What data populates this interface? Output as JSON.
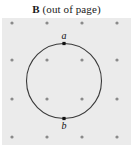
{
  "figure": {
    "caption": {
      "symbol": "B",
      "note": "(out of page)",
      "full_text": "B (out of page)"
    },
    "field": {
      "background_color": "#ebebeb",
      "dot_color": "#8a8a8a",
      "dot_symbol_name": "field-out-of-page-dot",
      "grid_columns": 4,
      "grid_rows": 4,
      "dot_count": 16,
      "dot_positions_x": [
        12,
        47,
        82,
        117
      ],
      "dot_positions_y": [
        23,
        60,
        99,
        137
      ],
      "box": {
        "x": 2,
        "y": 18,
        "width": 129,
        "height": 127
      }
    },
    "circle": {
      "center_x": 64,
      "center_y": 81,
      "radius": 37.5,
      "stroke_color": "#3a3a3a",
      "stroke_width": 1.1,
      "fill": "none"
    },
    "points": [
      {
        "id": "a",
        "label": "a",
        "x": 64,
        "y": 43.5,
        "label_x": 64,
        "label_y": 36,
        "marker_color": "#111111",
        "marker_size": 3.2,
        "position": "top"
      },
      {
        "id": "b",
        "label": "b",
        "x": 64,
        "y": 118.5,
        "label_x": 64,
        "label_y": 126,
        "marker_color": "#111111",
        "marker_size": 3.2,
        "position": "bottom"
      }
    ]
  }
}
